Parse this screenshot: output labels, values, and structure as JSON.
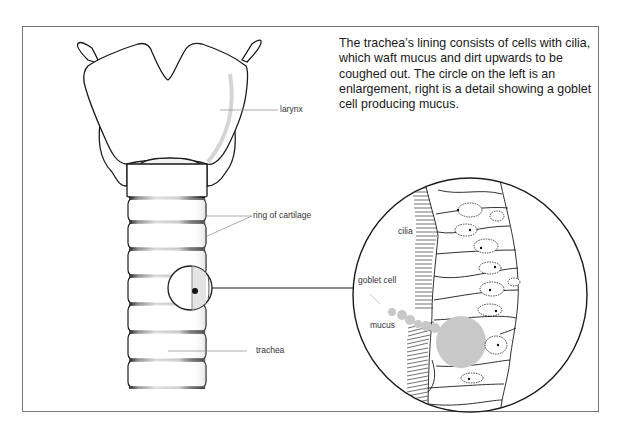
{
  "caption": "The trachea’s lining consists of cells with cilia, which waft mucus and dirt upwards to be coughed out. The circle on the left is an enlargement, right is a detail showing a goblet cell producing mucus.",
  "labels": {
    "larynx": "larynx",
    "ring_of_cartilage": "ring of cartilage",
    "trachea": "trachea",
    "cilia": "cilia",
    "goblet_cell": "goblet cell",
    "mucus": "mucus"
  },
  "colors": {
    "line": "#1a1a1a",
    "leader": "#888888",
    "mucus": "#c8c8c8",
    "frame": "#777777"
  }
}
